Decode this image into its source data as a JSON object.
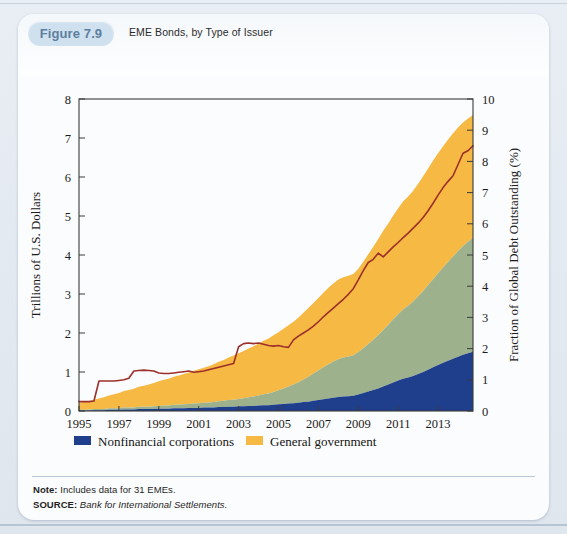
{
  "figure": {
    "badge_label": "Figure 7.9",
    "title": "EME Bonds, by Type of Issuer"
  },
  "footnotes": {
    "note_label": "Note:",
    "note_text": " Includes data for 31 EMEs.",
    "source_label": "SOURCE:",
    "source_text": " Bank for International Settlements."
  },
  "colors": {
    "nonfinancial": "#1f3f8c",
    "financial": "#9db28c",
    "government": "#f6b944",
    "line": "#9c2f2a",
    "axis": "#3a3a3a",
    "badge_bg": "#cfe0ef",
    "badge_text": "#5d7f9e",
    "card_bg": "#fbfcfd",
    "page_bg": "#e4eaf1"
  },
  "legend": {
    "items": [
      {
        "label": "Nonfinancial corporations",
        "swatch": "#1f3f8c",
        "type": "area"
      },
      {
        "label": "General government",
        "swatch": "#f6b944",
        "type": "area"
      },
      {
        "label": "Financial corporations",
        "swatch": "#9db28c",
        "type": "area"
      },
      {
        "label": "Fraction of Global Debt Outstanding (right)",
        "swatch": "#9c2f2a",
        "type": "line"
      }
    ]
  },
  "chart_data": {
    "type": "area",
    "title": "EME Bonds, by Type of Issuer",
    "xlabel": "",
    "ylabel": "Trillions of U.S. Dollars",
    "y2label": "Fraction of Global Debt Outstanding (%)",
    "xlim": [
      1995,
      2014.75
    ],
    "ylim": [
      0,
      8
    ],
    "y2lim": [
      0,
      10
    ],
    "yticks": [
      0,
      1,
      2,
      3,
      4,
      5,
      6,
      7,
      8
    ],
    "y2ticks": [
      0,
      1,
      2,
      3,
      4,
      5,
      6,
      7,
      8,
      9,
      10
    ],
    "xticks": [
      1995,
      1997,
      1999,
      2001,
      2003,
      2005,
      2007,
      2009,
      2011,
      2013
    ],
    "xticklabels": [
      "1995",
      "1997",
      "1999",
      "2001",
      "2003",
      "2005",
      "2007",
      "2009",
      "2011",
      "2013"
    ],
    "grid": false,
    "legend_position": "below",
    "stacked": true,
    "stack_order": [
      "Nonfinancial corporations",
      "Financial corporations",
      "General government"
    ],
    "x": [
      1995,
      1995.25,
      1995.5,
      1995.75,
      1996,
      1996.25,
      1996.5,
      1996.75,
      1997,
      1997.25,
      1997.5,
      1997.75,
      1998,
      1998.25,
      1998.5,
      1998.75,
      1999,
      1999.25,
      1999.5,
      1999.75,
      2000,
      2000.25,
      2000.5,
      2000.75,
      2001,
      2001.25,
      2001.5,
      2001.75,
      2002,
      2002.25,
      2002.5,
      2002.75,
      2003,
      2003.25,
      2003.5,
      2003.75,
      2004,
      2004.25,
      2004.5,
      2004.75,
      2005,
      2005.25,
      2005.5,
      2005.75,
      2006,
      2006.25,
      2006.5,
      2006.75,
      2007,
      2007.25,
      2007.5,
      2007.75,
      2008,
      2008.25,
      2008.5,
      2008.75,
      2009,
      2009.25,
      2009.5,
      2009.75,
      2010,
      2010.25,
      2010.5,
      2010.75,
      2011,
      2011.25,
      2011.5,
      2011.75,
      2012,
      2012.25,
      2012.5,
      2012.75,
      2013,
      2013.25,
      2013.5,
      2013.75,
      2014,
      2014.25,
      2014.5,
      2014.75
    ],
    "series": [
      {
        "name": "Nonfinancial corporations",
        "color": "#1f3f8c",
        "values": [
          0.01,
          0.01,
          0.01,
          0.02,
          0.02,
          0.02,
          0.03,
          0.03,
          0.03,
          0.04,
          0.04,
          0.04,
          0.05,
          0.05,
          0.05,
          0.05,
          0.06,
          0.06,
          0.06,
          0.07,
          0.07,
          0.07,
          0.08,
          0.08,
          0.08,
          0.09,
          0.09,
          0.09,
          0.1,
          0.1,
          0.11,
          0.11,
          0.12,
          0.12,
          0.13,
          0.13,
          0.14,
          0.15,
          0.15,
          0.16,
          0.17,
          0.18,
          0.19,
          0.2,
          0.21,
          0.23,
          0.24,
          0.26,
          0.28,
          0.3,
          0.32,
          0.34,
          0.36,
          0.37,
          0.38,
          0.39,
          0.42,
          0.46,
          0.5,
          0.54,
          0.58,
          0.63,
          0.68,
          0.73,
          0.78,
          0.83,
          0.86,
          0.9,
          0.95,
          1.0,
          1.06,
          1.12,
          1.18,
          1.24,
          1.29,
          1.34,
          1.39,
          1.44,
          1.48,
          1.52
        ]
      },
      {
        "name": "Financial corporations",
        "color": "#9db28c",
        "values": [
          0.02,
          0.02,
          0.02,
          0.03,
          0.03,
          0.03,
          0.04,
          0.04,
          0.04,
          0.05,
          0.05,
          0.05,
          0.06,
          0.06,
          0.06,
          0.07,
          0.07,
          0.08,
          0.08,
          0.09,
          0.09,
          0.1,
          0.1,
          0.11,
          0.12,
          0.12,
          0.13,
          0.14,
          0.15,
          0.16,
          0.17,
          0.18,
          0.19,
          0.21,
          0.22,
          0.24,
          0.26,
          0.28,
          0.3,
          0.33,
          0.36,
          0.4,
          0.44,
          0.48,
          0.53,
          0.58,
          0.64,
          0.7,
          0.76,
          0.82,
          0.88,
          0.93,
          0.97,
          1.0,
          1.02,
          1.04,
          1.09,
          1.15,
          1.22,
          1.29,
          1.37,
          1.45,
          1.53,
          1.62,
          1.7,
          1.78,
          1.84,
          1.91,
          1.99,
          2.08,
          2.17,
          2.26,
          2.35,
          2.44,
          2.53,
          2.62,
          2.71,
          2.79,
          2.86,
          2.92
        ]
      },
      {
        "name": "General government",
        "color": "#f6b944",
        "values": [
          0.18,
          0.2,
          0.22,
          0.24,
          0.27,
          0.3,
          0.33,
          0.36,
          0.39,
          0.42,
          0.45,
          0.48,
          0.51,
          0.54,
          0.57,
          0.6,
          0.63,
          0.66,
          0.69,
          0.72,
          0.75,
          0.78,
          0.81,
          0.84,
          0.87,
          0.9,
          0.93,
          0.97,
          1.01,
          1.05,
          1.09,
          1.13,
          1.17,
          1.21,
          1.25,
          1.29,
          1.33,
          1.37,
          1.41,
          1.45,
          1.49,
          1.53,
          1.57,
          1.61,
          1.66,
          1.71,
          1.76,
          1.81,
          1.86,
          1.91,
          1.96,
          2.0,
          2.04,
          2.06,
          2.07,
          2.08,
          2.14,
          2.22,
          2.3,
          2.38,
          2.46,
          2.54,
          2.6,
          2.66,
          2.72,
          2.77,
          2.8,
          2.84,
          2.89,
          2.94,
          2.99,
          3.04,
          3.08,
          3.11,
          3.14,
          3.16,
          3.17,
          3.17,
          3.16,
          3.15
        ]
      }
    ],
    "line_series": {
      "name": "Fraction of Global Debt Outstanding (right)",
      "color": "#9c2f2a",
      "axis": "right",
      "unit": "%",
      "values": [
        0.3,
        0.3,
        0.3,
        0.32,
        0.96,
        0.96,
        0.96,
        0.96,
        0.98,
        1.0,
        1.05,
        1.28,
        1.3,
        1.31,
        1.3,
        1.28,
        1.22,
        1.2,
        1.2,
        1.22,
        1.24,
        1.26,
        1.28,
        1.24,
        1.26,
        1.28,
        1.32,
        1.36,
        1.4,
        1.44,
        1.48,
        1.52,
        2.06,
        2.16,
        2.18,
        2.16,
        2.18,
        2.14,
        2.1,
        2.08,
        2.1,
        2.06,
        2.04,
        2.28,
        2.4,
        2.5,
        2.6,
        2.72,
        2.86,
        3.02,
        3.16,
        3.3,
        3.44,
        3.58,
        3.74,
        3.92,
        4.2,
        4.5,
        4.76,
        4.86,
        5.06,
        4.94,
        5.1,
        5.26,
        5.4,
        5.56,
        5.7,
        5.86,
        6.02,
        6.2,
        6.42,
        6.66,
        6.92,
        7.16,
        7.36,
        7.54,
        7.9,
        8.26,
        8.34,
        8.5
      ]
    }
  }
}
